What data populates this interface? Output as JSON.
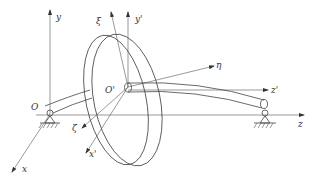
{
  "figure": {
    "colors": {
      "line": "#444444",
      "label": "#333333",
      "background": "#ffffff"
    }
  },
  "labels": {
    "y": "y",
    "xi": "ξ",
    "y_prime": "y'",
    "eta": "η",
    "z_prime": "z'",
    "o_prime": "O'",
    "o": "O",
    "zeta": "ζ",
    "x_prime": "x'",
    "x": "x",
    "z": "z"
  }
}
